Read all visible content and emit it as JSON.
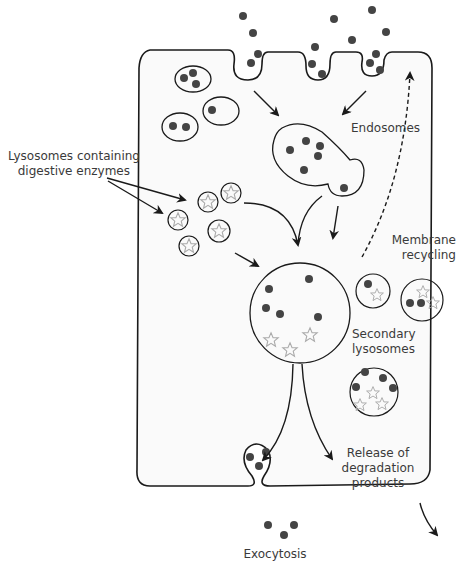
{
  "diagram": {
    "labels": {
      "lysosomes_line1": "Lysosomes containing",
      "lysosomes_line2": "digestive enzymes",
      "endosomes": "Endosomes",
      "membrane_line1": "Membrane",
      "membrane_line2": "recycling",
      "secondary_line1": "Secondary",
      "secondary_line2": "lysosomes",
      "release_line1": "Release of",
      "release_line2": "degradation",
      "release_line3": "products",
      "exocytosis": "Exocytosis"
    },
    "colors": {
      "outline": "#1a1a1a",
      "particle": "#444444",
      "enzyme_star": "#aaaaaa",
      "cell_fill": "#fafafa",
      "text": "#3a3a3a"
    }
  }
}
